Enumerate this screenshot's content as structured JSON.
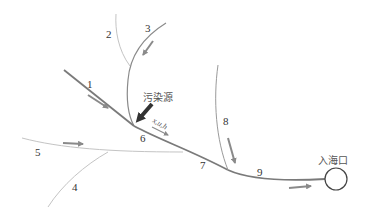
{
  "colors": {
    "main_river": "#7a7a7a",
    "tributary_dark": "#8a8a8a",
    "tributary_light": "#c4c4c4",
    "flow_arrow": "#8a8a8a",
    "source_arrow": "#333333",
    "outlet_circle": "#444444"
  },
  "segments": [
    {
      "id": "1",
      "label": "1"
    },
    {
      "id": "2",
      "label": "2"
    },
    {
      "id": "3",
      "label": "3"
    },
    {
      "id": "4",
      "label": "4"
    },
    {
      "id": "5",
      "label": "5"
    },
    {
      "id": "6",
      "label": "6"
    },
    {
      "id": "7",
      "label": "7"
    },
    {
      "id": "8",
      "label": "8"
    },
    {
      "id": "9",
      "label": "9"
    }
  ],
  "pollution_source": {
    "label": "污染源"
  },
  "state_variables": {
    "label": "x,u,h"
  },
  "outlet": {
    "label": "入海口"
  }
}
